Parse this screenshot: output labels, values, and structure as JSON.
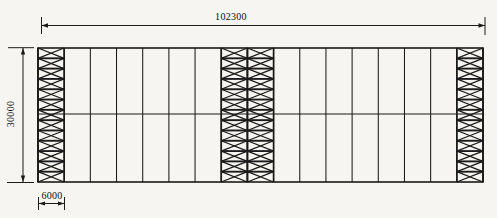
{
  "diagram": {
    "type": "structural-bracing-elevation",
    "dimensions": {
      "overall_width": "102300",
      "overall_height": "30000",
      "bay_width": "6000"
    },
    "structure": {
      "bay_count": 17,
      "row_count": 2,
      "braced_bay_positions": [
        1,
        8,
        9,
        17
      ],
      "brace_cells_per_bay": 13,
      "brace_pattern": "x-cross"
    },
    "colors": {
      "line": "#1b1b1b",
      "background": "#f6f5f1"
    }
  }
}
